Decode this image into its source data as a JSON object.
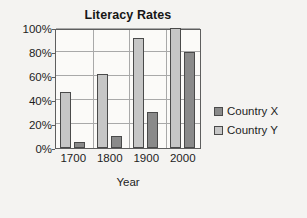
{
  "chart_data": {
    "type": "bar",
    "title": "Literacy Rates",
    "xlabel": "Year",
    "ylabel": "",
    "categories": [
      "1700",
      "1800",
      "1900",
      "2000"
    ],
    "series": [
      {
        "name": "Country X",
        "color": "#8a8a8a",
        "values": [
          5,
          10,
          30,
          80
        ]
      },
      {
        "name": "Country Y",
        "color": "#c6c6c6",
        "values": [
          47,
          62,
          92,
          100
        ]
      }
    ],
    "series_draw_order": [
      "Country Y",
      "Country X"
    ],
    "ylim": [
      0,
      100
    ],
    "ytick_values": [
      0,
      20,
      40,
      60,
      80,
      100
    ],
    "ytick_labels": [
      "0%",
      "20%",
      "40%",
      "60%",
      "80%",
      "100%"
    ],
    "grid": {
      "horizontal": true,
      "vertical": true
    },
    "legend": {
      "position": "right",
      "entries": [
        "Country X",
        "Country Y"
      ]
    }
  }
}
